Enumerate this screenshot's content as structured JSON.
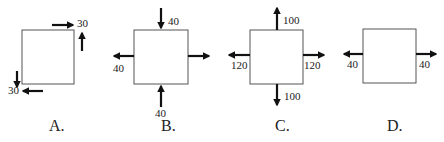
{
  "options": [
    {
      "label": "A.",
      "forces": [
        {
          "position": "top-right-horizontal",
          "direction": "right",
          "value": "30"
        },
        {
          "position": "right-vertical",
          "direction": "up",
          "value": ""
        },
        {
          "position": "left-vertical",
          "direction": "down",
          "value": ""
        },
        {
          "position": "bottom-left-horizontal",
          "direction": "left",
          "value": "30"
        }
      ],
      "labels": {
        "top_right": "30",
        "bottom_left": "30"
      }
    },
    {
      "label": "B.",
      "forces": [
        {
          "position": "top",
          "direction": "down",
          "value": "40"
        },
        {
          "position": "left",
          "direction": "left",
          "value": "40"
        },
        {
          "position": "right",
          "direction": "right",
          "value": ""
        },
        {
          "position": "bottom",
          "direction": "up",
          "value": "40"
        }
      ],
      "labels": {
        "top": "40",
        "left": "40",
        "bottom": "40"
      }
    },
    {
      "label": "C.",
      "forces": [
        {
          "position": "top",
          "direction": "up",
          "value": "100"
        },
        {
          "position": "left",
          "direction": "left",
          "value": "120"
        },
        {
          "position": "right",
          "direction": "right",
          "value": "120"
        },
        {
          "position": "bottom",
          "direction": "down",
          "value": "100"
        }
      ],
      "labels": {
        "top": "100",
        "left": "120",
        "right": "120",
        "bottom": "100"
      }
    },
    {
      "label": "D.",
      "forces": [
        {
          "position": "left",
          "direction": "left",
          "value": "40"
        },
        {
          "position": "right",
          "direction": "right",
          "value": "40"
        }
      ],
      "labels": {
        "left": "40",
        "right": "40"
      }
    }
  ]
}
